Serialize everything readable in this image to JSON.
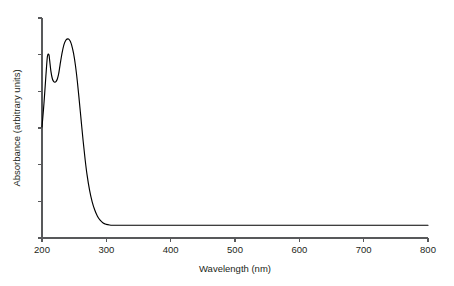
{
  "chart_data": {
    "type": "line",
    "title": "",
    "xlabel": "Wavelength (nm)",
    "ylabel": "Absorbance (arbitrary units)",
    "xlim": [
      200,
      800
    ],
    "ylim": [
      0,
      1
    ],
    "grid": false,
    "legend": null,
    "x_ticks": [
      200,
      300,
      400,
      500,
      600,
      700,
      800
    ],
    "x_tick_labels": [
      "200",
      "300",
      "400",
      "500",
      "600",
      "700",
      "800"
    ],
    "y_ticks": [
      0.0,
      0.1667,
      0.3333,
      0.5,
      0.6667,
      0.8333,
      1.0
    ],
    "y_tick_labels": [
      "",
      "",
      "",
      "",
      "",
      "",
      ""
    ],
    "series": [
      {
        "name": "absorbance",
        "color": "#000000",
        "x": [
          200,
          203,
          206,
          208,
          209,
          210,
          211,
          212,
          214,
          216,
          218,
          220,
          222,
          224,
          226,
          228,
          231,
          234,
          237,
          240,
          242,
          244,
          246,
          249,
          252,
          255,
          258,
          261,
          264,
          267,
          270,
          274,
          278,
          282,
          286,
          290,
          295,
          300,
          305,
          310,
          320,
          340,
          380,
          440,
          520,
          620,
          720,
          800
        ],
        "y": [
          0.505,
          0.61,
          0.735,
          0.815,
          0.832,
          0.836,
          0.83,
          0.805,
          0.755,
          0.725,
          0.712,
          0.708,
          0.712,
          0.724,
          0.748,
          0.785,
          0.838,
          0.878,
          0.899,
          0.905,
          0.903,
          0.894,
          0.878,
          0.84,
          0.784,
          0.71,
          0.622,
          0.53,
          0.44,
          0.358,
          0.288,
          0.216,
          0.164,
          0.127,
          0.1,
          0.082,
          0.068,
          0.062,
          0.059,
          0.058,
          0.058,
          0.058,
          0.058,
          0.058,
          0.058,
          0.058,
          0.058,
          0.058
        ]
      }
    ]
  },
  "plot_geometry": {
    "left": 42,
    "right": 428,
    "top": 18,
    "bottom": 238
  },
  "colors": {
    "background": "#ffffff",
    "axis": "#58595b",
    "curve": "#000000",
    "text": "#231f20"
  }
}
